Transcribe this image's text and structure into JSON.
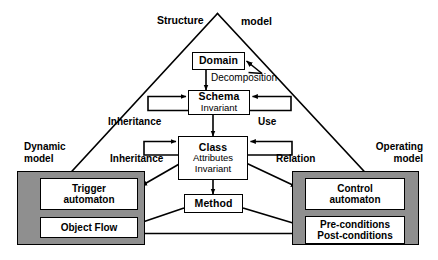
{
  "diagram": {
    "title_left": "Structure",
    "title_right": "model",
    "corner_left": {
      "line1": "Dynamic",
      "line2": "model"
    },
    "corner_right": {
      "line1": "Operating",
      "line2": "model"
    },
    "nodes": {
      "domain": {
        "label": "Domain"
      },
      "schema": {
        "label": "Schema",
        "sub": "Invariant"
      },
      "class": {
        "label": "Class",
        "sub1": "Attributes",
        "sub2": "Invariant"
      },
      "method": {
        "label": "Method"
      },
      "trigger": {
        "line1": "Trigger",
        "line2": "automaton"
      },
      "object_flow": {
        "label": "Object Flow"
      },
      "control": {
        "line1": "Control",
        "line2": "automaton"
      },
      "conditions": {
        "line1": "Pre-conditions",
        "line2": "Post-conditions"
      }
    },
    "edge_labels": {
      "decomposition": "Decomposition",
      "inheritance_schema": "Inheritance",
      "use_schema": "Use",
      "inheritance_class": "Inheritance",
      "relation_class": "Relation"
    },
    "colors": {
      "panel_fill": "#8f8f8f",
      "box_fill": "#ffffff",
      "stroke": "#000000",
      "background": "#ffffff"
    }
  }
}
